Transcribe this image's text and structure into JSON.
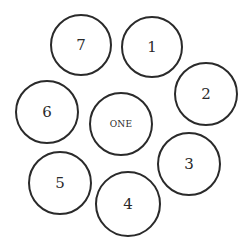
{
  "diagram": {
    "center": {
      "label": "ONE",
      "cx": 121,
      "cy": 124,
      "r": 32
    },
    "outer": [
      {
        "label": "1",
        "cx": 152,
        "cy": 47,
        "r": 31
      },
      {
        "label": "2",
        "cx": 206,
        "cy": 94,
        "r": 32
      },
      {
        "label": "3",
        "cx": 189,
        "cy": 164,
        "r": 32
      },
      {
        "label": "4",
        "cx": 128,
        "cy": 204,
        "r": 33
      },
      {
        "label": "5",
        "cx": 60,
        "cy": 183,
        "r": 32
      },
      {
        "label": "6",
        "cx": 47,
        "cy": 112,
        "r": 32
      },
      {
        "label": "7",
        "cx": 81,
        "cy": 45,
        "r": 31
      }
    ],
    "stroke_color": "#2a2a2a"
  }
}
